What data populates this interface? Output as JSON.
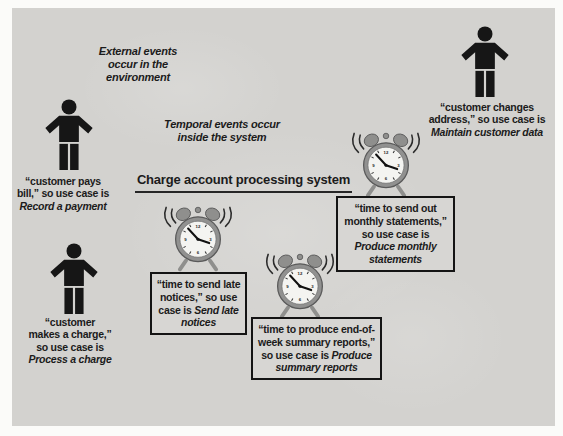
{
  "colors": {
    "page_bg": "#fbfbf9",
    "panel_bg": "#d3d2cf",
    "box_bg": "#d7d6d3",
    "ink": "#1b1b1b",
    "clock_body": "#8f8f8d",
    "clock_face": "#f4f4f1"
  },
  "icons": {
    "actor": "person-icon",
    "clock": "alarm-clock-icon",
    "clock_numerals": [
      "12",
      "3",
      "6",
      "9"
    ]
  },
  "diagram": {
    "title": "Charge account processing system",
    "note_external": "External events\noccur in the\nenvironment",
    "note_temporal": "Temporal events occur\ninside the system",
    "actors": [
      {
        "prefix": "“customer pays bill,” so use case is ",
        "usecase": "Record a payment"
      },
      {
        "prefix": "“customer makes a charge,” so use case is ",
        "usecase": "Process a charge"
      },
      {
        "prefix": "“customer changes address,” so use case is ",
        "usecase": "Maintain customer data"
      }
    ],
    "temporal_boxes": [
      {
        "prefix": "“time to send late notices,” so use case is ",
        "usecase": "Send late notices"
      },
      {
        "prefix": "“time to send out monthly statements,” so use case is ",
        "usecase": "Produce monthly statements"
      },
      {
        "prefix": "“time to produce end-of-week summary reports,” so use case is ",
        "usecase": "Produce summary reports"
      }
    ]
  }
}
